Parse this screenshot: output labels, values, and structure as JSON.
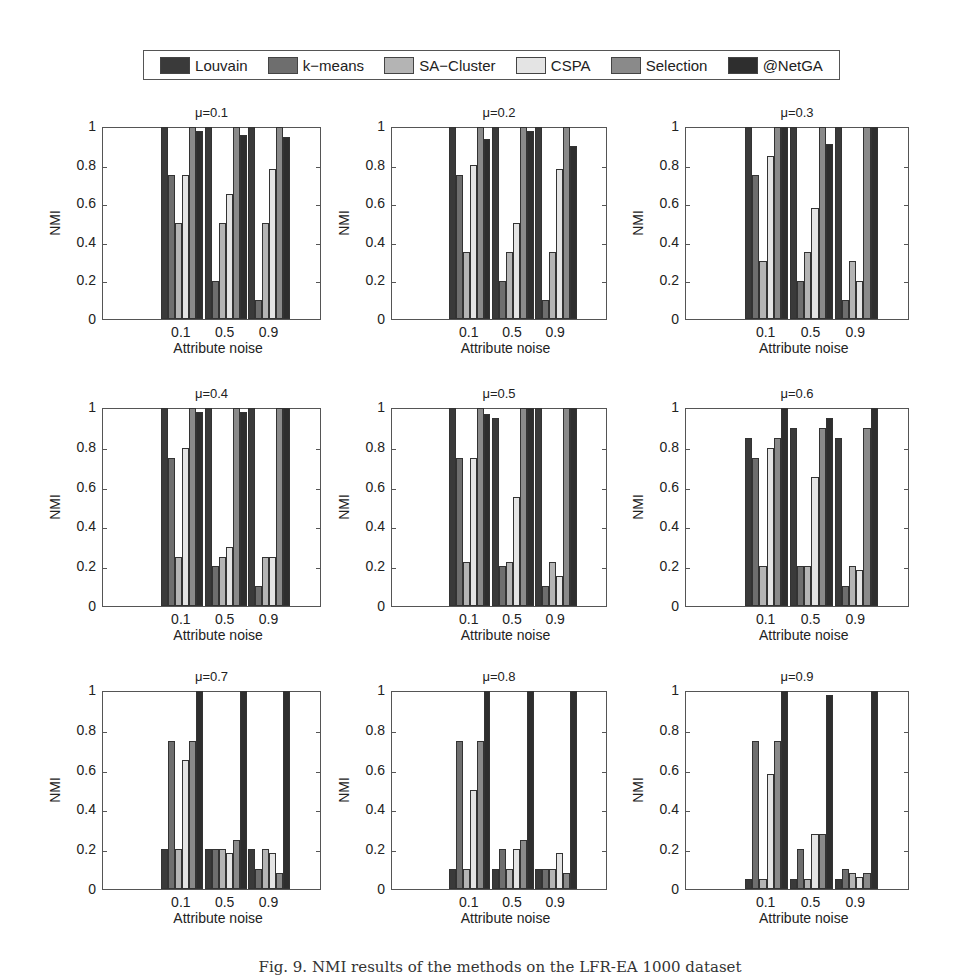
{
  "legend": {
    "items": [
      {
        "label": "Louvain",
        "color": "#3a3a3a"
      },
      {
        "label": "k−means",
        "color": "#6e6e6e"
      },
      {
        "label": "SA−Cluster",
        "color": "#b4b4b4"
      },
      {
        "label": "CSPA",
        "color": "#e4e4e4"
      },
      {
        "label": "Selection",
        "color": "#8a8a8a"
      },
      {
        "label": "@NetGA",
        "color": "#2e2e2e"
      }
    ]
  },
  "caption": "Fig. 9.  NMI results of the methods on the LFR-EA 1000 dataset",
  "chart_data": [
    {
      "type": "bar",
      "title": "μ=0.1",
      "xlabel": "Attribute noise",
      "ylabel": "NMI",
      "ylim": [
        0,
        1
      ],
      "yticks": [
        "0",
        "0.2",
        "0.4",
        "0.6",
        "0.8",
        "1"
      ],
      "categories": [
        "0.1",
        "0.5",
        "0.9"
      ],
      "series": [
        {
          "name": "Louvain",
          "values": [
            1.0,
            1.0,
            1.0
          ]
        },
        {
          "name": "k-means",
          "values": [
            0.75,
            0.2,
            0.1
          ]
        },
        {
          "name": "SA-Cluster",
          "values": [
            0.5,
            0.5,
            0.5
          ]
        },
        {
          "name": "CSPA",
          "values": [
            0.75,
            0.65,
            0.78
          ]
        },
        {
          "name": "Selection",
          "values": [
            1.0,
            1.0,
            1.0
          ]
        },
        {
          "name": "@NetGA",
          "values": [
            0.98,
            0.96,
            0.95
          ]
        }
      ]
    },
    {
      "type": "bar",
      "title": "μ=0.2",
      "xlabel": "Attribute noise",
      "ylabel": "NMI",
      "ylim": [
        0,
        1
      ],
      "yticks": [
        "0",
        "0.2",
        "0.4",
        "0.6",
        "0.8",
        "1"
      ],
      "categories": [
        "0.1",
        "0.5",
        "0.9"
      ],
      "series": [
        {
          "name": "Louvain",
          "values": [
            1.0,
            1.0,
            1.0
          ]
        },
        {
          "name": "k-means",
          "values": [
            0.75,
            0.2,
            0.1
          ]
        },
        {
          "name": "SA-Cluster",
          "values": [
            0.35,
            0.35,
            0.35
          ]
        },
        {
          "name": "CSPA",
          "values": [
            0.8,
            0.5,
            0.78
          ]
        },
        {
          "name": "Selection",
          "values": [
            1.0,
            1.0,
            1.0
          ]
        },
        {
          "name": "@NetGA",
          "values": [
            0.94,
            0.98,
            0.9
          ]
        }
      ]
    },
    {
      "type": "bar",
      "title": "μ=0.3",
      "xlabel": "Attribute noise",
      "ylabel": "NMI",
      "ylim": [
        0,
        1
      ],
      "yticks": [
        "0",
        "0.2",
        "0.4",
        "0.6",
        "0.8",
        "1"
      ],
      "categories": [
        "0.1",
        "0.5",
        "0.9"
      ],
      "series": [
        {
          "name": "Louvain",
          "values": [
            1.0,
            1.0,
            1.0
          ]
        },
        {
          "name": "k-means",
          "values": [
            0.75,
            0.2,
            0.1
          ]
        },
        {
          "name": "SA-Cluster",
          "values": [
            0.3,
            0.35,
            0.3
          ]
        },
        {
          "name": "CSPA",
          "values": [
            0.85,
            0.58,
            0.2
          ]
        },
        {
          "name": "Selection",
          "values": [
            1.0,
            1.0,
            1.0
          ]
        },
        {
          "name": "@NetGA",
          "values": [
            1.0,
            0.91,
            1.0
          ]
        }
      ]
    },
    {
      "type": "bar",
      "title": "μ=0.4",
      "xlabel": "Attribute noise",
      "ylabel": "NMI",
      "ylim": [
        0,
        1
      ],
      "yticks": [
        "0",
        "0.2",
        "0.4",
        "0.6",
        "0.8",
        "1"
      ],
      "categories": [
        "0.1",
        "0.5",
        "0.9"
      ],
      "series": [
        {
          "name": "Louvain",
          "values": [
            1.0,
            1.0,
            1.0
          ]
        },
        {
          "name": "k-means",
          "values": [
            0.75,
            0.2,
            0.1
          ]
        },
        {
          "name": "SA-Cluster",
          "values": [
            0.25,
            0.25,
            0.25
          ]
        },
        {
          "name": "CSPA",
          "values": [
            0.8,
            0.3,
            0.25
          ]
        },
        {
          "name": "Selection",
          "values": [
            1.0,
            1.0,
            1.0
          ]
        },
        {
          "name": "@NetGA",
          "values": [
            0.98,
            0.98,
            1.0
          ]
        }
      ]
    },
    {
      "type": "bar",
      "title": "μ=0.5",
      "xlabel": "Attribute noise",
      "ylabel": "NMI",
      "ylim": [
        0,
        1
      ],
      "yticks": [
        "0",
        "0.2",
        "0.4",
        "0.6",
        "0.8",
        "1"
      ],
      "categories": [
        "0.1",
        "0.5",
        "0.9"
      ],
      "series": [
        {
          "name": "Louvain",
          "values": [
            1.0,
            0.95,
            1.0
          ]
        },
        {
          "name": "k-means",
          "values": [
            0.75,
            0.2,
            0.1
          ]
        },
        {
          "name": "SA-Cluster",
          "values": [
            0.22,
            0.22,
            0.22
          ]
        },
        {
          "name": "CSPA",
          "values": [
            0.75,
            0.55,
            0.15
          ]
        },
        {
          "name": "Selection",
          "values": [
            1.0,
            1.0,
            1.0
          ]
        },
        {
          "name": "@NetGA",
          "values": [
            0.97,
            1.0,
            1.0
          ]
        }
      ]
    },
    {
      "type": "bar",
      "title": "μ=0.6",
      "xlabel": "Attribute noise",
      "ylabel": "NMI",
      "ylim": [
        0,
        1
      ],
      "yticks": [
        "0",
        "0.2",
        "0.4",
        "0.6",
        "0.8",
        "1"
      ],
      "categories": [
        "0.1",
        "0.5",
        "0.9"
      ],
      "series": [
        {
          "name": "Louvain",
          "values": [
            0.85,
            0.9,
            0.85
          ]
        },
        {
          "name": "k-means",
          "values": [
            0.75,
            0.2,
            0.1
          ]
        },
        {
          "name": "SA-Cluster",
          "values": [
            0.2,
            0.2,
            0.2
          ]
        },
        {
          "name": "CSPA",
          "values": [
            0.8,
            0.65,
            0.18
          ]
        },
        {
          "name": "Selection",
          "values": [
            0.85,
            0.9,
            0.9
          ]
        },
        {
          "name": "@NetGA",
          "values": [
            1.0,
            0.95,
            1.0
          ]
        }
      ]
    },
    {
      "type": "bar",
      "title": "μ=0.7",
      "xlabel": "Attribute noise",
      "ylabel": "NMI",
      "ylim": [
        0,
        1
      ],
      "yticks": [
        "0",
        "0.2",
        "0.4",
        "0.6",
        "0.8",
        "1"
      ],
      "categories": [
        "0.1",
        "0.5",
        "0.9"
      ],
      "series": [
        {
          "name": "Louvain",
          "values": [
            0.2,
            0.2,
            0.2
          ]
        },
        {
          "name": "k-means",
          "values": [
            0.75,
            0.2,
            0.1
          ]
        },
        {
          "name": "SA-Cluster",
          "values": [
            0.2,
            0.2,
            0.2
          ]
        },
        {
          "name": "CSPA",
          "values": [
            0.65,
            0.18,
            0.18
          ]
        },
        {
          "name": "Selection",
          "values": [
            0.75,
            0.25,
            0.08
          ]
        },
        {
          "name": "@NetGA",
          "values": [
            1.0,
            1.0,
            1.0
          ]
        }
      ]
    },
    {
      "type": "bar",
      "title": "μ=0.8",
      "xlabel": "Attribute noise",
      "ylabel": "NMI",
      "ylim": [
        0,
        1
      ],
      "yticks": [
        "0",
        "0.2",
        "0.4",
        "0.6",
        "0.8",
        "1"
      ],
      "categories": [
        "0.1",
        "0.5",
        "0.9"
      ],
      "series": [
        {
          "name": "Louvain",
          "values": [
            0.1,
            0.1,
            0.1
          ]
        },
        {
          "name": "k-means",
          "values": [
            0.75,
            0.2,
            0.1
          ]
        },
        {
          "name": "SA-Cluster",
          "values": [
            0.1,
            0.1,
            0.1
          ]
        },
        {
          "name": "CSPA",
          "values": [
            0.5,
            0.2,
            0.18
          ]
        },
        {
          "name": "Selection",
          "values": [
            0.75,
            0.25,
            0.08
          ]
        },
        {
          "name": "@NetGA",
          "values": [
            1.0,
            1.0,
            1.0
          ]
        }
      ]
    },
    {
      "type": "bar",
      "title": "μ=0.9",
      "xlabel": "Attribute noise",
      "ylabel": "NMI",
      "ylim": [
        0,
        1
      ],
      "yticks": [
        "0",
        "0.2",
        "0.4",
        "0.6",
        "0.8",
        "1"
      ],
      "categories": [
        "0.1",
        "0.5",
        "0.9"
      ],
      "series": [
        {
          "name": "Louvain",
          "values": [
            0.05,
            0.05,
            0.05
          ]
        },
        {
          "name": "k-means",
          "values": [
            0.75,
            0.2,
            0.1
          ]
        },
        {
          "name": "SA-Cluster",
          "values": [
            0.05,
            0.05,
            0.08
          ]
        },
        {
          "name": "CSPA",
          "values": [
            0.58,
            0.28,
            0.06
          ]
        },
        {
          "name": "Selection",
          "values": [
            0.75,
            0.28,
            0.08
          ]
        },
        {
          "name": "@NetGA",
          "values": [
            1.0,
            0.98,
            1.0
          ]
        }
      ]
    }
  ]
}
